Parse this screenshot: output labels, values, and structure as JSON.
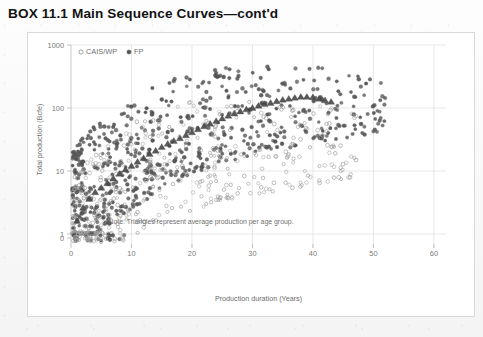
{
  "box": {
    "title": "BOX 11.1 Main Sequence Curves—cont'd"
  },
  "chart_data": {
    "type": "scatter",
    "title": "",
    "xlabel": "Production duration (Years)",
    "ylabel": "Total production (Bcfe)",
    "xlim": [
      0,
      62
    ],
    "ylim": [
      1,
      1000
    ],
    "yscale": "log",
    "y_zero_break": true,
    "xticks": [
      0,
      10,
      20,
      30,
      40,
      50,
      60
    ],
    "xtick_labels": [
      "0",
      "10",
      "20",
      "30",
      "40",
      "50",
      "60"
    ],
    "yticks": [
      1,
      10,
      100,
      1000
    ],
    "ytick_labels": [
      "1",
      "10",
      "100",
      "1000"
    ],
    "y_zero_label": "0",
    "grid": true,
    "legend_position": "top-left",
    "legend": [
      {
        "name": "CAIS/WP",
        "marker": "open-circle",
        "color": "#ffffff",
        "edge": "#9a9a9a"
      },
      {
        "name": "FP",
        "marker": "filled-circle",
        "color": "#555555",
        "edge": "#444444"
      }
    ],
    "annotations": [
      {
        "text": "Note: Triangles represent average production per age group.",
        "x": 21.5,
        "y": 1.45
      }
    ],
    "series": [
      {
        "name": "FP",
        "marker": "filled-circle",
        "color": "#555555",
        "point_count": 620,
        "x_range": [
          0.3,
          52
        ],
        "density_profile": "dense-left-decaying-right",
        "trend": "rising-log",
        "envelope_low": [
          0.35,
          1.2,
          2.5,
          5.0,
          9.0,
          13.0,
          18.0,
          22.0,
          28.0,
          33.0,
          40.0,
          55.0
        ],
        "envelope_high": [
          22,
          70,
          150,
          260,
          360,
          430,
          470,
          500,
          460,
          390,
          300,
          210
        ]
      },
      {
        "name": "CAIS/WP",
        "marker": "open-circle",
        "color": "#ffffff",
        "edge": "#9e9e9e",
        "point_count": 470,
        "x_range": [
          0.3,
          47
        ],
        "density_profile": "dense-left-decaying-right",
        "trend": "rising-log-lower",
        "envelope_low": [
          0.2,
          0.5,
          0.9,
          1.5,
          2.4,
          3.2,
          4.0,
          5.0,
          6.0,
          7.5,
          9.0,
          11.0
        ],
        "envelope_high": [
          8,
          26,
          58,
          95,
          130,
          150,
          160,
          155,
          140,
          120,
          95,
          70
        ]
      },
      {
        "name": "Average production per age group",
        "marker": "triangle",
        "color": "#4a4a4a",
        "x": [
          1,
          2,
          3,
          4,
          5,
          6,
          7,
          8,
          9,
          10,
          11,
          12,
          13,
          14,
          15,
          16,
          17,
          18,
          19,
          20,
          21,
          22,
          23,
          24,
          25,
          26,
          27,
          28,
          29,
          30,
          31,
          32,
          33,
          34,
          35,
          36,
          37,
          38,
          39,
          40,
          41,
          42,
          43
        ],
        "y": [
          1.6,
          2.6,
          3.6,
          4.6,
          5.4,
          6.4,
          7.6,
          9.0,
          10.5,
          12.0,
          14.0,
          16.0,
          18.5,
          21.0,
          24.0,
          27.0,
          30.0,
          33.0,
          37.0,
          41.0,
          46.0,
          51.0,
          56.0,
          62.0,
          68.0,
          75.0,
          82.0,
          88.0,
          95.0,
          100.0,
          108.0,
          115.0,
          120.0,
          128.0,
          135.0,
          140.0,
          145.0,
          150.0,
          150.0,
          148.0,
          140.0,
          132.0,
          125.0
        ]
      }
    ],
    "zero_points": {
      "description": "points plotted at the zero axis break below 1",
      "fp_count": 26,
      "cais_count": 34,
      "x_range": [
        0.4,
        9.0
      ]
    }
  }
}
